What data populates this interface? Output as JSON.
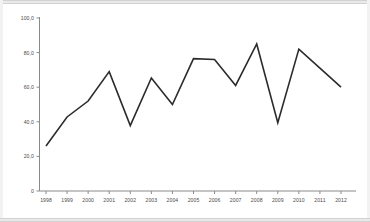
{
  "chart_data": {
    "type": "line",
    "title": "",
    "subtitle": "",
    "xlabel": "",
    "ylabel": "",
    "x": [
      "1998",
      "1999",
      "2000",
      "2001",
      "2002",
      "2003",
      "2004",
      "2005",
      "2006",
      "2007",
      "2008",
      "2009",
      "2010",
      "2011",
      "2012"
    ],
    "values": [
      26.0,
      42.8,
      52.0,
      69.0,
      37.8,
      65.3,
      50.0,
      76.5,
      76.0,
      61.0,
      85.0,
      39.5,
      82.0,
      71.0,
      60.0
    ],
    "series": [
      {
        "name": "",
        "values": [
          26.0,
          42.8,
          52.0,
          69.0,
          37.8,
          65.3,
          50.0,
          76.5,
          76.0,
          61.0,
          85.0,
          39.5,
          82.0,
          71.0,
          60.0
        ]
      }
    ],
    "xlim": [
      "1998",
      "2012"
    ],
    "ylim": [
      0,
      100
    ],
    "ytick_values": [
      0,
      20,
      40,
      60,
      80,
      100
    ],
    "ytick_labels": [
      "0",
      "20,0",
      "40,0",
      "60,0",
      "80,0",
      "100,0"
    ],
    "xtick_labels": [
      "1998",
      "1999",
      "2000",
      "2001",
      "2002",
      "2003",
      "2004",
      "2005",
      "2006",
      "2007",
      "2008",
      "2009",
      "2010",
      "2011",
      "2012"
    ],
    "grid": false,
    "legend": false,
    "legend_position": "none",
    "line_color": "#2b2b2b",
    "axis_color": "#8a8a8a",
    "background_color": "#ffffff",
    "annotations": []
  },
  "figure": {
    "frame_color": "#e9e9e9",
    "border_color": "#d2d2d2"
  }
}
